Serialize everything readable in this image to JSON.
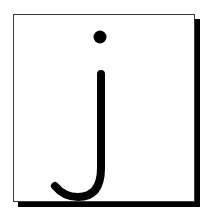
{
  "card": {
    "letter": "j",
    "letter_color": "#000000",
    "background_color": "#ffffff",
    "border_color": "#3a3a3a",
    "shadow_color": "#000000"
  }
}
